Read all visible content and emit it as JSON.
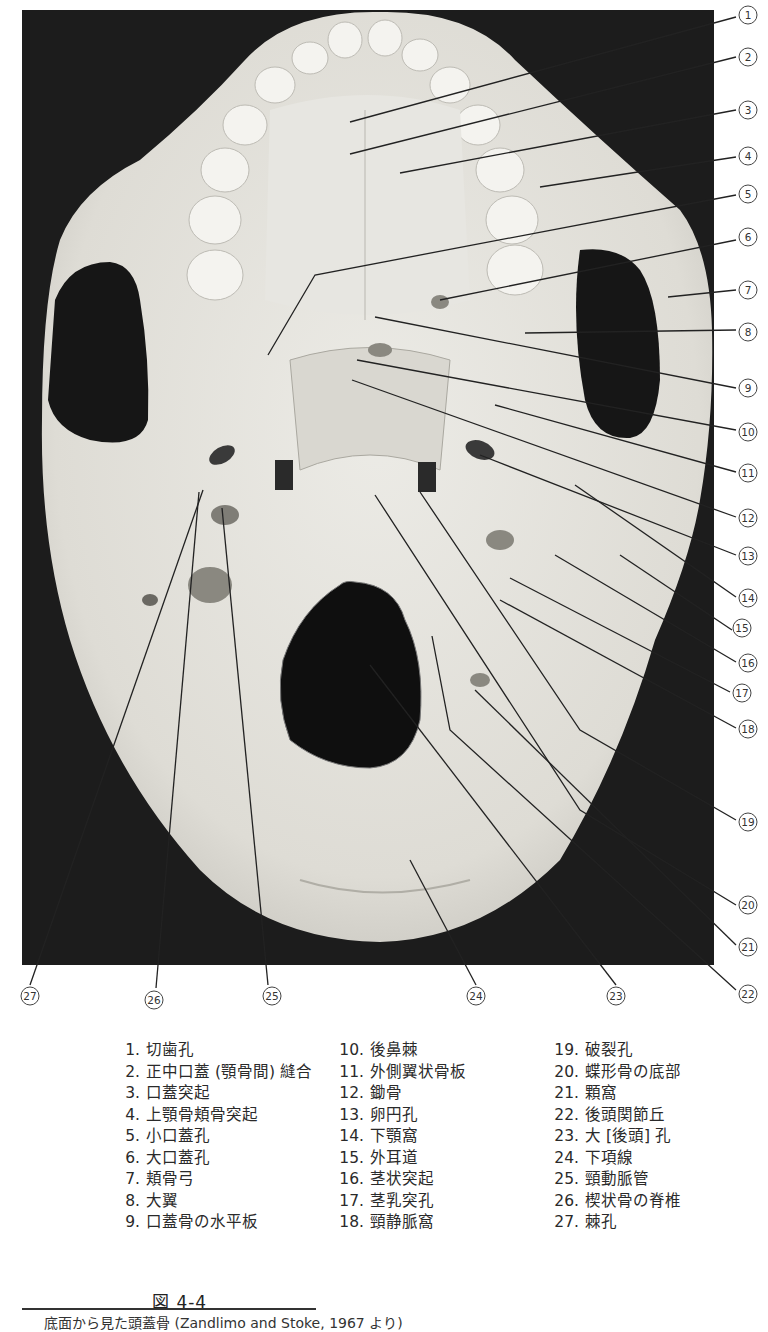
{
  "figure": {
    "number": "図 4-4",
    "caption": "底面から見た頭蓋骨 (Zandlimo and Stoke, 1967 より)",
    "photo": {
      "subject": "skull-inferior-view",
      "background": "#1c1c1c",
      "bone": "#e4e2dc"
    },
    "callouts": [
      {
        "n": 1,
        "glyph": "①"
      },
      {
        "n": 2,
        "glyph": "②"
      },
      {
        "n": 3,
        "glyph": "③"
      },
      {
        "n": 4,
        "glyph": "④"
      },
      {
        "n": 5,
        "glyph": "⑤"
      },
      {
        "n": 6,
        "glyph": "⑥"
      },
      {
        "n": 7,
        "glyph": "⑦"
      },
      {
        "n": 8,
        "glyph": "⑧"
      },
      {
        "n": 9,
        "glyph": "⑨"
      },
      {
        "n": 10,
        "glyph": "⑩"
      },
      {
        "n": 11,
        "glyph": "⑪"
      },
      {
        "n": 12,
        "glyph": "⑫"
      },
      {
        "n": 13,
        "glyph": "⑬"
      },
      {
        "n": 14,
        "glyph": "⑭"
      },
      {
        "n": 15,
        "glyph": "⑮"
      },
      {
        "n": 16,
        "glyph": "⑯"
      },
      {
        "n": 17,
        "glyph": "⑰"
      },
      {
        "n": 18,
        "glyph": "⑱"
      },
      {
        "n": 19,
        "glyph": "⑲"
      },
      {
        "n": 20,
        "glyph": "⑳"
      },
      {
        "n": 21,
        "glyph": "㉑"
      },
      {
        "n": 22,
        "glyph": "㉒"
      },
      {
        "n": 23,
        "glyph": "㉓"
      },
      {
        "n": 24,
        "glyph": "㉔"
      },
      {
        "n": 25,
        "glyph": "㉕"
      },
      {
        "n": 26,
        "glyph": "㉖"
      },
      {
        "n": 27,
        "glyph": "㉗"
      }
    ]
  },
  "legend": {
    "columns": [
      [
        {
          "num": "1.",
          "label": "切歯孔"
        },
        {
          "num": "2.",
          "label": "正中口蓋 (顎骨間) 縫合"
        },
        {
          "num": "3.",
          "label": "口蓋突起"
        },
        {
          "num": "4.",
          "label": "上顎骨頬骨突起"
        },
        {
          "num": "5.",
          "label": "小口蓋孔"
        },
        {
          "num": "6.",
          "label": "大口蓋孔"
        },
        {
          "num": "7.",
          "label": "頬骨弓"
        },
        {
          "num": "8.",
          "label": "大翼"
        },
        {
          "num": "9.",
          "label": "口蓋骨の水平板"
        }
      ],
      [
        {
          "num": "10.",
          "label": "後鼻棘"
        },
        {
          "num": "11.",
          "label": "外側翼状骨板"
        },
        {
          "num": "12.",
          "label": "鋤骨"
        },
        {
          "num": "13.",
          "label": "卵円孔"
        },
        {
          "num": "14.",
          "label": "下顎窩"
        },
        {
          "num": "15.",
          "label": "外耳道"
        },
        {
          "num": "16.",
          "label": "茎状突起"
        },
        {
          "num": "17.",
          "label": "茎乳突孔"
        },
        {
          "num": "18.",
          "label": "頸静脈窩"
        }
      ],
      [
        {
          "num": "19.",
          "label": "破裂孔"
        },
        {
          "num": "20.",
          "label": "蝶形骨の底部"
        },
        {
          "num": "21.",
          "label": "顆窩"
        },
        {
          "num": "22.",
          "label": "後頭関節丘"
        },
        {
          "num": "23.",
          "label": "大 [後頭] 孔"
        },
        {
          "num": "24.",
          "label": "下項線"
        },
        {
          "num": "25.",
          "label": "頸動脈管"
        },
        {
          "num": "26.",
          "label": "楔状骨の脊椎"
        },
        {
          "num": "27.",
          "label": "棘孔"
        }
      ]
    ]
  }
}
